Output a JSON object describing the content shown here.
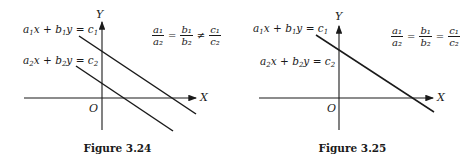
{
  "figures": [
    {
      "caption": "Figure 3.24",
      "eq1": {
        "a": "a",
        "as": "1",
        "x": "x",
        "plus": "+",
        "b": "b",
        "bs": "1",
        "y": "y",
        "eqs": "=",
        "c": "c",
        "cs": "1"
      },
      "eq2": {
        "a": "a",
        "as": "2",
        "x": "x",
        "plus": "+",
        "b": "b",
        "bs": "2",
        "y": "y",
        "eqs": "=",
        "c": "c",
        "cs": "2"
      },
      "axis_x": "X",
      "axis_y": "Y",
      "origin": "O",
      "condition": {
        "f1_num": "a₁",
        "f1_den": "a₂",
        "op1": "=",
        "f2_num": "b₁",
        "f2_den": "b₂",
        "op2": "≠",
        "f3_num": "c₁",
        "f3_den": "c₂"
      },
      "description": "Two parallel lines (inconsistent system, no solution)"
    },
    {
      "caption": "Figure 3.25",
      "eq1": {
        "a": "a",
        "as": "1",
        "x": "x",
        "plus": "+",
        "b": "b",
        "bs": "1",
        "y": "y",
        "eqs": "=",
        "c": "c",
        "cs": "1"
      },
      "eq2": {
        "a": "a",
        "as": "2",
        "x": "x",
        "plus": "+",
        "b": "b",
        "bs": "2",
        "y": "y",
        "eqs": "=",
        "c": "c",
        "cs": "2"
      },
      "axis_x": "X",
      "axis_y": "Y",
      "origin": "O",
      "condition": {
        "f1_num": "a₁",
        "f1_den": "a₂",
        "op1": "=",
        "f2_num": "b₁",
        "f2_den": "b₂",
        "op2": "=",
        "f3_num": "c₁",
        "f3_den": "c₂"
      },
      "description": "Coincident lines (infinitely many solutions)"
    }
  ],
  "colors": {
    "ink": "#1a1a1a",
    "background": "#ffffff"
  }
}
